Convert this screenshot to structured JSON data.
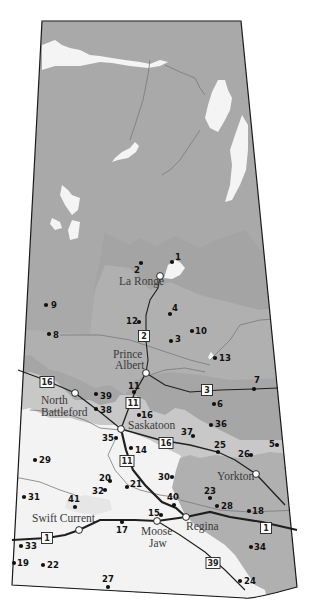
{
  "map": {
    "colors": {
      "background": "#ffffff",
      "north": "#a8a8a8",
      "mid_dark": "#9c9c9c",
      "mid": "#b5b5b5",
      "light": "#cfcfcf",
      "prairie": "#f2f2f2",
      "southeast": "#b0b0b0",
      "lake": "#f4f4f4",
      "border": "#1a1a1a",
      "highway": "#222222",
      "river": "#6e6e6e"
    },
    "cities": [
      {
        "name": "La Ronge",
        "x": 160,
        "y": 276,
        "lx": 119,
        "ly": 285
      },
      {
        "name": "Prince Albert",
        "x": 146,
        "y": 373,
        "lx": 113,
        "ly": 358,
        "line2": "Albert",
        "l2x": 115,
        "l2y": 369
      },
      {
        "name": "North",
        "x": 75,
        "y": 393,
        "lx": 41,
        "ly": 404,
        "line2": "Battleford",
        "l2x": 41,
        "l2y": 416
      },
      {
        "name": "Saskatoon",
        "x": 121,
        "y": 429,
        "lx": 128,
        "ly": 429
      },
      {
        "name": "Yorkton",
        "x": 256,
        "y": 474,
        "lx": 217,
        "ly": 480
      },
      {
        "name": "Swift Current",
        "x": 79,
        "y": 530,
        "lx": 32,
        "ly": 522
      },
      {
        "name": "Moose",
        "x": 157,
        "y": 521,
        "lx": 141,
        "ly": 535,
        "line2": "Jaw",
        "l2x": 149,
        "l2y": 547
      },
      {
        "name": "Regina",
        "x": 186,
        "y": 517,
        "lx": 186,
        "ly": 530
      }
    ],
    "sites": [
      {
        "n": "1",
        "x": 172,
        "y": 262,
        "lx": 175,
        "ly": 260
      },
      {
        "n": "2",
        "x": 141,
        "y": 263,
        "lx": 134,
        "ly": 273
      },
      {
        "n": "3",
        "x": 171,
        "y": 341,
        "lx": 175,
        "ly": 342
      },
      {
        "n": "4",
        "x": 170,
        "y": 314,
        "lx": 172,
        "ly": 311
      },
      {
        "n": "5",
        "x": 277,
        "y": 445,
        "lx": 269,
        "ly": 447
      },
      {
        "name_hint": "",
        "n": "6",
        "x": 214,
        "y": 404,
        "lx": 217,
        "ly": 407
      },
      {
        "n": "7",
        "x": 254,
        "y": 389,
        "lx": 254,
        "ly": 383
      },
      {
        "n": "8",
        "x": 49,
        "y": 334,
        "lx": 53,
        "ly": 338
      },
      {
        "n": "9",
        "x": 46,
        "y": 305,
        "lx": 51,
        "ly": 308
      },
      {
        "n": "10",
        "x": 192,
        "y": 331,
        "lx": 195,
        "ly": 334
      },
      {
        "n": "11",
        "x": 134,
        "y": 392,
        "lx": 128,
        "ly": 389
      },
      {
        "n": "12",
        "x": 139,
        "y": 322,
        "lx": 126,
        "ly": 324
      },
      {
        "n": "13",
        "x": 215,
        "y": 358,
        "lx": 219,
        "ly": 361
      },
      {
        "n": "14",
        "x": 131,
        "y": 448,
        "lx": 135,
        "ly": 453
      },
      {
        "n": "15",
        "x": 161,
        "y": 515,
        "lx": 148,
        "ly": 516
      },
      {
        "n": "16",
        "x": 139,
        "y": 415,
        "lx": 141,
        "ly": 418
      },
      {
        "n": "17",
        "x": 122,
        "y": 522,
        "lx": 116,
        "ly": 533
      },
      {
        "n": "18",
        "x": 249,
        "y": 511,
        "lx": 252,
        "ly": 514
      },
      {
        "n": "19",
        "x": 14,
        "y": 563,
        "lx": 17,
        "ly": 566
      },
      {
        "n": "20",
        "x": 110,
        "y": 481,
        "lx": 99,
        "ly": 481
      },
      {
        "n": "21",
        "x": 127,
        "y": 487,
        "lx": 130,
        "ly": 487
      },
      {
        "n": "22",
        "x": 43,
        "y": 565,
        "lx": 47,
        "ly": 568
      },
      {
        "n": "23",
        "x": 210,
        "y": 498,
        "lx": 204,
        "ly": 494
      },
      {
        "n": "24",
        "x": 240,
        "y": 581,
        "lx": 244,
        "ly": 584
      },
      {
        "n": "25",
        "x": 218,
        "y": 452,
        "lx": 214,
        "ly": 448
      },
      {
        "n": "26",
        "x": 251,
        "y": 455,
        "lx": 238,
        "ly": 457
      },
      {
        "n": "27",
        "x": 108,
        "y": 587,
        "lx": 102,
        "ly": 582
      },
      {
        "n": "28",
        "x": 217,
        "y": 506,
        "lx": 221,
        "ly": 509
      },
      {
        "n": "29",
        "x": 35,
        "y": 460,
        "lx": 39,
        "ly": 463
      },
      {
        "n": "30",
        "x": 172,
        "y": 477,
        "lx": 158,
        "ly": 480
      },
      {
        "n": "31",
        "x": 24,
        "y": 497,
        "lx": 28,
        "ly": 500
      },
      {
        "n": "32",
        "x": 105,
        "y": 490,
        "lx": 92,
        "ly": 494
      },
      {
        "n": "33",
        "x": 21,
        "y": 546,
        "lx": 25,
        "ly": 549
      },
      {
        "n": "34",
        "x": 251,
        "y": 547,
        "lx": 254,
        "ly": 550
      },
      {
        "n": "35",
        "x": 116,
        "y": 438,
        "lx": 102,
        "ly": 441
      },
      {
        "n": "36",
        "x": 211,
        "y": 425,
        "lx": 215,
        "ly": 427
      },
      {
        "n": "37",
        "x": 193,
        "y": 436,
        "lx": 181,
        "ly": 435
      },
      {
        "n": "38",
        "x": 96,
        "y": 409,
        "lx": 100,
        "ly": 413
      },
      {
        "n": "39",
        "x": 96,
        "y": 394,
        "lx": 100,
        "ly": 399
      },
      {
        "n": "40",
        "x": 174,
        "y": 505,
        "lx": 167,
        "ly": 500
      },
      {
        "n": "41",
        "x": 75,
        "y": 507,
        "lx": 68,
        "ly": 502
      }
    ],
    "highways": [
      {
        "label": "16",
        "x": 47,
        "y": 382
      },
      {
        "label": "2",
        "x": 144,
        "y": 336
      },
      {
        "label": "3",
        "x": 207,
        "y": 390
      },
      {
        "label": "11",
        "x": 133,
        "y": 403
      },
      {
        "label": "16",
        "x": 166,
        "y": 443
      },
      {
        "label": "11",
        "x": 127,
        "y": 461
      },
      {
        "label": "1",
        "x": 266,
        "y": 528
      },
      {
        "label": "1",
        "x": 47,
        "y": 538
      },
      {
        "label": "39",
        "x": 213,
        "y": 563
      }
    ]
  }
}
